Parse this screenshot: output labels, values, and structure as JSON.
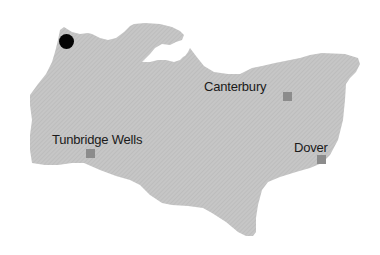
{
  "map": {
    "region_fill": "#c4c4c4",
    "background": "#ffffff",
    "marker_color": "#8c8c8c",
    "location_dot_color": "#050505",
    "cities": [
      {
        "name": "Canterbury",
        "label_x": 204,
        "label_y": 80,
        "marker_x": 283,
        "marker_y": 92
      },
      {
        "name": "Tunbridge Wells",
        "label_x": 52,
        "label_y": 133,
        "marker_x": 86,
        "marker_y": 149
      },
      {
        "name": "Dover",
        "label_x": 294,
        "label_y": 141,
        "marker_x": 317,
        "marker_y": 155
      }
    ],
    "location_dot": {
      "x": 59,
      "y": 34,
      "size": 15
    }
  }
}
